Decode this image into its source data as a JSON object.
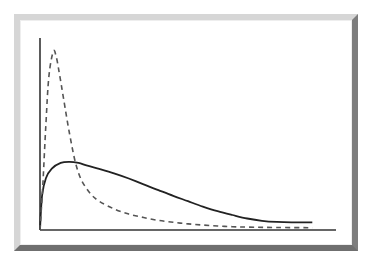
{
  "chart_data": {
    "type": "line",
    "title": "",
    "xlabel": "",
    "ylabel": "",
    "grid": false,
    "legend": null,
    "axes": {
      "origin_px": [
        40,
        230
      ],
      "x_end_px": 336,
      "y_top_px": 38
    },
    "xlim": [
      0,
      1
    ],
    "ylim": [
      0,
      1
    ],
    "series": [
      {
        "name": "solid-curve",
        "style": "solid",
        "color": "#222222",
        "stroke_width": 1.8,
        "x": [
          0.0,
          0.007,
          0.02,
          0.04,
          0.07,
          0.1,
          0.13,
          0.16,
          0.2,
          0.25,
          0.3,
          0.35,
          0.4,
          0.45,
          0.5,
          0.55,
          0.6,
          0.65,
          0.7,
          0.75,
          0.8,
          0.85,
          0.92
        ],
        "y": [
          0.0,
          0.18,
          0.27,
          0.32,
          0.35,
          0.355,
          0.35,
          0.335,
          0.318,
          0.295,
          0.268,
          0.238,
          0.208,
          0.178,
          0.15,
          0.122,
          0.098,
          0.078,
          0.06,
          0.048,
          0.042,
          0.04,
          0.04
        ]
      },
      {
        "name": "dashed-curve",
        "style": "dashed",
        "color": "#555555",
        "stroke_width": 1.6,
        "x": [
          0.0,
          0.01,
          0.02,
          0.03,
          0.045,
          0.055,
          0.065,
          0.08,
          0.1,
          0.12,
          0.14,
          0.17,
          0.2,
          0.25,
          0.3,
          0.35,
          0.4,
          0.45,
          0.5,
          0.55,
          0.6,
          0.65,
          0.7,
          0.8,
          0.92
        ],
        "y": [
          0.0,
          0.25,
          0.55,
          0.8,
          0.93,
          0.9,
          0.82,
          0.68,
          0.5,
          0.35,
          0.26,
          0.19,
          0.15,
          0.11,
          0.083,
          0.065,
          0.05,
          0.04,
          0.032,
          0.026,
          0.021,
          0.017,
          0.015,
          0.013,
          0.012
        ]
      }
    ]
  },
  "figure": {
    "frame_color_light": "#d6d6d6",
    "frame_color_dark": "#7d7d7d",
    "axis_color": "#333333"
  }
}
